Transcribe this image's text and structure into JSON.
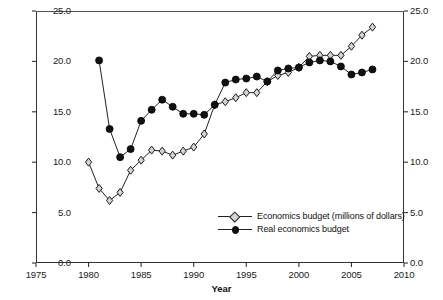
{
  "chart_data": {
    "type": "line",
    "title": "",
    "xlabel": "Year",
    "ylabel": "",
    "xlim": [
      1975,
      2010
    ],
    "ylim": [
      0.0,
      25.0
    ],
    "grid": false,
    "legend_position": "inside-bottom-right",
    "dual_axis": true,
    "xticks": [
      "1975",
      "1980",
      "1985",
      "1990",
      "1995",
      "2000",
      "2005",
      "2010"
    ],
    "xtick_values": [
      1975,
      1980,
      1985,
      1990,
      1995,
      2000,
      2005,
      2010
    ],
    "yticks": [
      "0.0",
      "5.0",
      "10.0",
      "15.0",
      "20.0",
      "25.0"
    ],
    "ytick_values": [
      0.0,
      5.0,
      10.0,
      15.0,
      20.0,
      25.0
    ],
    "yticks_right": [
      "0.0",
      "5.0",
      "10.0",
      "15.0",
      "20.0",
      "25.0"
    ],
    "series": [
      {
        "name": "Economics budget (millions of dollars)",
        "marker": "open-diamond",
        "marker_fill": "#d4d4d4",
        "line_color": "#222222",
        "x": [
          1980,
          1981,
          1982,
          1983,
          1984,
          1985,
          1986,
          1987,
          1988,
          1989,
          1990,
          1991,
          1992,
          1993,
          1994,
          1995,
          1996,
          1997,
          1998,
          1999,
          2000,
          2001,
          2002,
          2003,
          2004,
          2005,
          2006,
          2007
        ],
        "values": [
          10.0,
          7.4,
          6.2,
          7.0,
          9.2,
          10.2,
          11.2,
          11.1,
          10.7,
          11.1,
          11.5,
          12.8,
          15.7,
          16.0,
          16.4,
          16.9,
          16.9,
          18.0,
          18.6,
          18.9,
          19.4,
          20.5,
          20.6,
          20.6,
          20.6,
          21.5,
          22.6,
          23.4
        ]
      },
      {
        "name": "Real economics budget",
        "marker": "filled-circle",
        "marker_fill": "#111111",
        "line_color": "#222222",
        "x": [
          1981,
          1982,
          1983,
          1984,
          1985,
          1986,
          1987,
          1988,
          1989,
          1990,
          1991,
          1992,
          1993,
          1994,
          1995,
          1996,
          1997,
          1998,
          1999,
          2000,
          2001,
          2002,
          2003,
          2004,
          2005,
          2006,
          2007
        ],
        "values": [
          20.1,
          13.3,
          10.5,
          11.3,
          14.1,
          15.2,
          16.2,
          15.5,
          14.8,
          14.8,
          14.7,
          15.7,
          17.9,
          18.2,
          18.3,
          18.5,
          18.0,
          19.1,
          19.3,
          19.4,
          19.9,
          20.1,
          20.0,
          19.5,
          18.7,
          18.9,
          19.2
        ]
      }
    ]
  },
  "legend": {
    "items": [
      {
        "label": "Economics budget (millions of dollars)",
        "marker": "open-diamond"
      },
      {
        "label": "Real economics budget",
        "marker": "filled-circle"
      }
    ]
  },
  "axis_title": {
    "x": "Year"
  }
}
